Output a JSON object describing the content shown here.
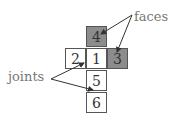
{
  "diagram": {
    "cells": [
      {
        "label": "4",
        "shaded": true
      },
      {
        "label": "2",
        "shaded": false
      },
      {
        "label": "1",
        "shaded": false
      },
      {
        "label": "3",
        "shaded": true
      },
      {
        "label": "5",
        "shaded": false
      },
      {
        "label": "6",
        "shaded": false
      }
    ],
    "labels": {
      "faces": "faces",
      "joints": "joints"
    },
    "colors": {
      "face_shade": "#8c8c8c",
      "border": "#555555",
      "label_text": "#777777"
    }
  }
}
